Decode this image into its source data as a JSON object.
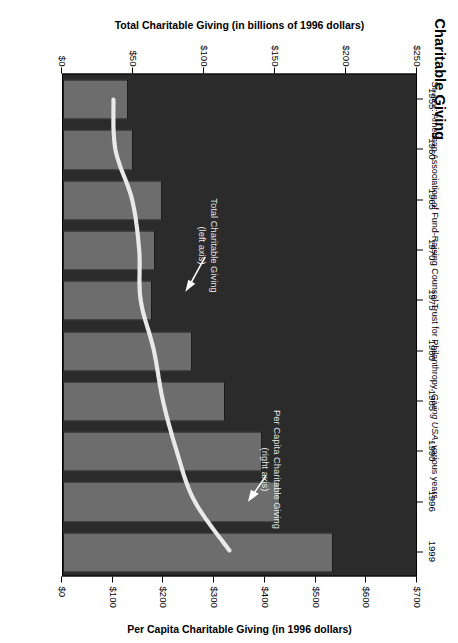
{
  "chart_data": {
    "type": "bar",
    "title": "Charitable Giving",
    "subtitle": "",
    "categories": [
      "1955",
      "1960",
      "1965",
      "1970",
      "1975",
      "1980",
      "1985",
      "1990",
      "1996",
      "1999"
    ],
    "series": [
      {
        "name": "Total Charitable Giving (left axis)",
        "type": "bar",
        "axis": "left",
        "unit": "billions of 1996 dollars",
        "values": [
          46,
          49,
          70,
          65,
          63,
          91,
          114,
          140,
          153,
          190
        ]
      },
      {
        "name": "Per Capita Charitable Giving (right axis)",
        "type": "line",
        "axis": "right",
        "unit": "1996 dollars",
        "values": [
          100,
          104,
          137,
          151,
          154,
          180,
          198,
          225,
          260,
          330
        ]
      }
    ],
    "xlabel": "",
    "ylabel_left": "Total Charitable Giving (in billions of 1996 dollars)",
    "ylabel_right": "Per Capita Charitable Giving (in 1996 dollars)",
    "ylim_left": [
      0,
      250
    ],
    "ylim_right": [
      0,
      700
    ],
    "yticks_left": [
      "$0",
      "$50",
      "$100",
      "$150",
      "$200",
      "$250"
    ],
    "yticks_right": [
      "$0",
      "$100",
      "$200",
      "$300",
      "$400",
      "$500",
      "$600",
      "$700"
    ],
    "grid": false,
    "legend": "inline-annotations",
    "annotations": [
      {
        "text_line1": "Total Charitable Giving",
        "text_line2": "(left axis)",
        "points_to": "bar"
      },
      {
        "text_line1": "Per Capita Charitable Giving",
        "text_line2": "(right axis)",
        "points_to": "line"
      }
    ],
    "source": {
      "prefix": "Source:",
      "text_before_italic": " American Association of Fund-Raising Counsel Trust for Philanthropy, ",
      "italic": "Giving USA",
      "text_after_italic": ", various years."
    },
    "colors": {
      "plot_background": "#2b2b2b",
      "bar_fill": "#6d6d6d",
      "line_stroke": "#e9e9e9",
      "text": "#000000",
      "annotation_text": "#e8e8e8",
      "page_background": "#ffffff"
    }
  },
  "annotations": {
    "total": {
      "line1": "Total Charitable Giving",
      "line2": "(left axis)"
    },
    "percap": {
      "line1": "Per Capita Charitable Giving",
      "line2": "(right axis)"
    }
  }
}
